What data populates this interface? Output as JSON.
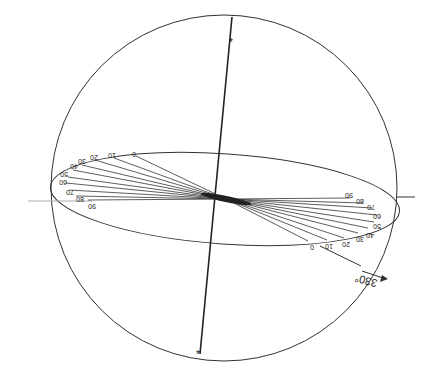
{
  "diagram": {
    "type": "stereographic-projection",
    "orientation": "rotated 180 degrees",
    "circle": {
      "cx": 224,
      "cy": 188,
      "r": 174,
      "stroke": "#333333"
    },
    "ellipse": {
      "cx": 224,
      "cy": 200,
      "rx": 176,
      "ry": 44,
      "rotate": 5,
      "stroke": "#333333"
    },
    "vertical_diameter": {
      "x1": 231,
      "y1": 17,
      "x2": 200,
      "y2": 354,
      "top_marker": "*",
      "bottom_marker": "*"
    },
    "horizontal_axis": {
      "left_stub": {
        "x1": 30,
        "y1": 201,
        "x2": 95,
        "y2": 201
      },
      "right_stub": {
        "x1": 395,
        "y1": 197,
        "x2": 415,
        "y2": 197
      }
    },
    "left_labels": [
      "0",
      "10",
      "20",
      "30",
      "40",
      "50",
      "60",
      "70",
      "80",
      "90"
    ],
    "right_labels": [
      "0",
      "10",
      "20",
      "30",
      "40",
      "50",
      "60",
      "70",
      "80",
      "90"
    ],
    "arrow": {
      "label": "330°",
      "direction": "outward-lower-right"
    },
    "line_color": "#333333"
  }
}
